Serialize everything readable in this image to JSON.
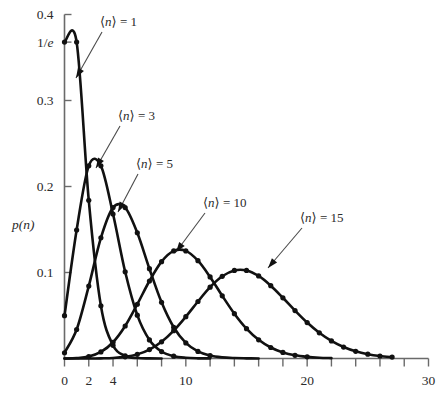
{
  "chart_data": {
    "type": "line",
    "title": "",
    "subtitle": "",
    "xlabel": "",
    "ylabel": "p(n)",
    "xlim": [
      0,
      30
    ],
    "ylim": [
      0,
      0.4
    ],
    "grid": false,
    "legend_position": "inline-annotations",
    "x_tick_labels": [
      "0",
      "2",
      "4",
      "10",
      "20",
      "30"
    ],
    "x_tick_values": [
      0,
      2,
      4,
      10,
      20,
      30
    ],
    "x_minor_tick_step": 2,
    "y_tick_labels": [
      "0.1",
      "0.2",
      "0.3",
      "1/e",
      "0.4"
    ],
    "y_tick_values": [
      0.1,
      0.2,
      0.3,
      0.3679,
      0.4
    ],
    "annotations": [
      {
        "text_prefix": "⟨",
        "text_var": "n",
        "text_suffix": "⟩ = 1",
        "label": "⟨n⟩ = 1",
        "mean": 1
      },
      {
        "text_prefix": "⟨",
        "text_var": "n",
        "text_suffix": "⟩ = 3",
        "label": "⟨n⟩ = 3",
        "mean": 3
      },
      {
        "text_prefix": "⟨",
        "text_var": "n",
        "text_suffix": "⟩ = 5",
        "label": "⟨n⟩ = 5",
        "mean": 5
      },
      {
        "text_prefix": "⟨",
        "text_var": "n",
        "text_suffix": "⟩ = 10",
        "label": "⟨n⟩ = 10",
        "mean": 10
      },
      {
        "text_prefix": "⟨",
        "text_var": "n",
        "text_suffix": "⟩ = 15",
        "label": "⟨n⟩ = 15",
        "mean": 15
      }
    ],
    "series": [
      {
        "name": "⟨n⟩ = 1",
        "mean": 1,
        "x": [
          0,
          1,
          2,
          3,
          4,
          5,
          6,
          7,
          8
        ],
        "values": [
          0.3679,
          0.3679,
          0.1839,
          0.0613,
          0.0153,
          0.0031,
          0.0005,
          0.0001,
          0.0
        ]
      },
      {
        "name": "⟨n⟩ = 3",
        "mean": 3,
        "x": [
          0,
          1,
          2,
          3,
          4,
          5,
          6,
          7,
          8,
          9,
          10,
          11,
          12
        ],
        "values": [
          0.0498,
          0.1494,
          0.224,
          0.224,
          0.168,
          0.1008,
          0.0504,
          0.0216,
          0.0081,
          0.0027,
          0.0008,
          0.0002,
          0.0001
        ]
      },
      {
        "name": "⟨n⟩ = 5",
        "mean": 5,
        "x": [
          0,
          1,
          2,
          3,
          4,
          5,
          6,
          7,
          8,
          9,
          10,
          11,
          12,
          13,
          14,
          15,
          16
        ],
        "values": [
          0.0067,
          0.0337,
          0.0842,
          0.1404,
          0.1755,
          0.1755,
          0.1462,
          0.1044,
          0.0653,
          0.0363,
          0.0181,
          0.0082,
          0.0034,
          0.0013,
          0.0005,
          0.0002,
          0.0
        ]
      },
      {
        "name": "⟨n⟩ = 10",
        "mean": 10,
        "x": [
          0,
          1,
          2,
          3,
          4,
          5,
          6,
          7,
          8,
          9,
          10,
          11,
          12,
          13,
          14,
          15,
          16,
          17,
          18,
          19,
          20,
          21,
          22
        ],
        "values": [
          0.0,
          0.0005,
          0.0023,
          0.0076,
          0.0189,
          0.0378,
          0.0631,
          0.0901,
          0.1126,
          0.1251,
          0.1251,
          0.1137,
          0.0948,
          0.0729,
          0.0521,
          0.0347,
          0.0217,
          0.0128,
          0.0071,
          0.0037,
          0.0019,
          0.0009,
          0.0004
        ]
      },
      {
        "name": "⟨n⟩ = 15",
        "mean": 15,
        "x": [
          0,
          1,
          2,
          3,
          4,
          5,
          6,
          7,
          8,
          9,
          10,
          11,
          12,
          13,
          14,
          15,
          16,
          17,
          18,
          19,
          20,
          21,
          22,
          23,
          24,
          25,
          26,
          27
        ],
        "values": [
          0.0,
          0.0,
          0.0,
          0.0002,
          0.0006,
          0.0019,
          0.0048,
          0.0104,
          0.0194,
          0.0324,
          0.0486,
          0.0663,
          0.0829,
          0.0956,
          0.1024,
          0.1024,
          0.096,
          0.0847,
          0.0706,
          0.0557,
          0.0418,
          0.0299,
          0.0204,
          0.0133,
          0.0083,
          0.005,
          0.0029,
          0.0016
        ]
      }
    ]
  }
}
